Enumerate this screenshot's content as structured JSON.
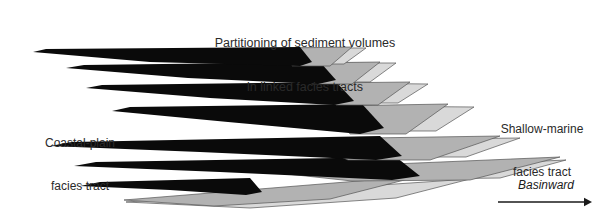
{
  "figure": {
    "title_line1": "Partitioning of sediment volumes",
    "title_line2": "in linked facies tracts",
    "label_coastal_line1": "Coastal-plain",
    "label_coastal_line2": "facies tract",
    "label_marine_line1": "Shallow-marine",
    "label_marine_line2": "facies tract",
    "label_direction": "Basinward",
    "arrow_icon_name": "basinward-arrow-icon"
  },
  "colors": {
    "background": "#ffffff",
    "coastal_plain_fill": "#0a0a0a",
    "shallow_marine_fill_mid": "#b2b2b2",
    "shallow_marine_fill_light": "#d9d9d9",
    "outline": "#555555",
    "text": "#2a2a2a",
    "arrow": "#1a1a1a"
  },
  "chart_data": {
    "type": "area",
    "title": "Partitioning of sediment volumes in linked facies tracts",
    "xlabel": "Basinward",
    "ylabel": "",
    "grid": false,
    "legend": [
      {
        "name": "Coastal-plain facies tract",
        "color": "#0a0a0a"
      },
      {
        "name": "Shallow-marine facies tract",
        "color": "#b2b2b2"
      }
    ],
    "units": [
      {
        "id": 1,
        "coastal_plain": {
          "fill": "#0a0a0a",
          "points": "33,52 46,49 300,47 312,62 300,66 150,62"
        },
        "marine_mid": {
          "fill": "#b2b2b2",
          "points": "288,48 352,47 330,66 292,66"
        },
        "marine_light": {
          "fill": "#d9d9d9",
          "points": "300,48 366,48 344,64 320,64"
        }
      },
      {
        "id": 2,
        "coastal_plain": {
          "fill": "#0a0a0a",
          "points": "66,68 84,65 320,62 336,80 318,84 188,78"
        },
        "marine_mid": {
          "fill": "#b2b2b2",
          "points": "305,63 380,62 352,84 312,84"
        },
        "marine_light": {
          "fill": "#d9d9d9",
          "points": "318,63 396,63 370,82 344,82"
        }
      },
      {
        "id": 3,
        "coastal_plain": {
          "fill": "#0a0a0a",
          "points": "86,88 102,85 336,82 354,101 334,105 210,98"
        },
        "marine_mid": {
          "fill": "#b2b2b2",
          "points": "322,83 410,82 378,105 336,105"
        },
        "marine_light": {
          "fill": "#d9d9d9",
          "points": "336,83 428,84 398,103 368,103"
        }
      },
      {
        "id": 4,
        "coastal_plain": {
          "fill": "#0a0a0a",
          "points": "112,111 130,107 362,104 384,128 360,134 228,122"
        },
        "marine_mid": {
          "fill": "#b2b2b2",
          "points": "330,106 448,104 406,134 350,134"
        },
        "marine_light": {
          "fill": "#d9d9d9",
          "points": "352,106 474,107 436,131 396,131"
        }
      },
      {
        "id": 5,
        "coastal_plain": {
          "fill": "#0a0a0a",
          "points": "50,146 72,142 380,136 402,156 376,160 200,152"
        },
        "marine_mid": {
          "fill": "#b2b2b2",
          "points": "300,139 500,136 430,160 348,160"
        },
        "marine_light": {
          "fill": "#d9d9d9",
          "points": "340,140 520,138 466,157 408,157"
        }
      },
      {
        "id": 6,
        "coastal_plain": {
          "fill": "#0a0a0a",
          "points": "74,166 96,162 396,157 420,176 392,180 220,172"
        },
        "marine_mid": {
          "fill": "#b2b2b2",
          "points": "250,170 560,157 470,180 352,181"
        },
        "marine_light": {
          "fill": "#d9d9d9",
          "points": "300,172 566,160 500,178 420,179"
        }
      },
      {
        "id": 7,
        "coastal_plain": {
          "fill": "#0a0a0a",
          "points": "80,186 100,182 250,178 262,192 246,195 170,190"
        },
        "marine_mid": {
          "fill": "#b2b2b2",
          "points": "124,200 420,176 330,199 214,206"
        },
        "marine_light": {
          "fill": "#d9d9d9",
          "points": "126,202 470,179 396,198 250,208"
        }
      }
    ],
    "arrow": {
      "x1": 498,
      "y1": 202,
      "x2": 592,
      "y2": 202,
      "label": "Basinward"
    }
  }
}
